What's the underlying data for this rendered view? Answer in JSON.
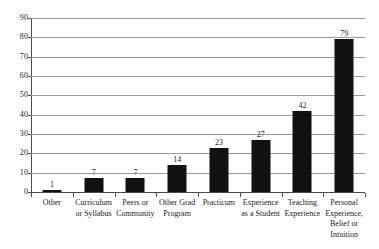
{
  "chart_data": {
    "type": "bar",
    "title": "",
    "xlabel": "",
    "ylabel": "",
    "ylim": [
      0,
      90
    ],
    "ytick_step": 10,
    "grid": true,
    "legend": "none",
    "bar_color": "#111111",
    "gridline_color": "#9a9a9a",
    "axis_color": "#4a4a4a",
    "categories": [
      "Other",
      "Curriculum or Syllabus",
      "Peers or Community",
      "Other Grad Program",
      "Practicum",
      "Experience as a Student",
      "Teaching Experience",
      "Personal Experience, Belief or Intuition"
    ],
    "category_lines": [
      [
        "Other"
      ],
      [
        "Curriculum",
        "or Syllabus"
      ],
      [
        "Peers or",
        "Community"
      ],
      [
        "Other Grad",
        "Program"
      ],
      [
        "Practicum"
      ],
      [
        "Experience",
        "as a Student"
      ],
      [
        "Teaching",
        "Experience"
      ],
      [
        "Personal",
        "Experience,",
        "Belief or",
        "Intuition"
      ]
    ],
    "values": [
      1,
      7,
      7,
      14,
      23,
      27,
      42,
      79
    ],
    "value_labels": [
      "1",
      "7",
      "7",
      "14",
      "23",
      "27",
      "42",
      "79"
    ],
    "yticks": [
      0,
      10,
      20,
      30,
      40,
      50,
      60,
      70,
      80,
      90
    ],
    "ytick_labels": [
      "0",
      "10",
      "20",
      "30",
      "40",
      "50",
      "60",
      "70",
      "80",
      "90"
    ]
  }
}
